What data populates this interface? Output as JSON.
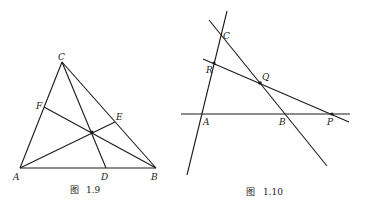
{
  "figures": [
    {
      "id": "fig-1-9",
      "caption": {
        "prefix": "图",
        "number": "1.9"
      },
      "points": {
        "A": {
          "label": "A",
          "x": 20,
          "y": 168
        },
        "B": {
          "label": "B",
          "x": 156,
          "y": 168
        },
        "C": {
          "label": "C",
          "x": 62,
          "y": 62
        },
        "D": {
          "label": "D",
          "x": 106,
          "y": 168
        },
        "E": {
          "label": "E",
          "x": 115,
          "y": 122
        },
        "F": {
          "label": "F",
          "x": 44,
          "y": 107
        },
        "O": {
          "x": 92,
          "y": 132
        }
      },
      "segments": [
        [
          "A",
          "B"
        ],
        [
          "B",
          "C"
        ],
        [
          "C",
          "A"
        ],
        [
          "C",
          "D"
        ],
        [
          "A",
          "E"
        ],
        [
          "B",
          "F"
        ]
      ]
    },
    {
      "id": "fig-1-10",
      "caption": {
        "prefix": "图",
        "number": "1.10"
      },
      "points": {
        "A": {
          "label": "A",
          "x": 202,
          "y": 114
        },
        "B": {
          "label": "B",
          "x": 285,
          "y": 114
        },
        "C": {
          "label": "C",
          "x": 221,
          "y": 34
        },
        "P": {
          "label": "P",
          "x": 332,
          "y": 114
        },
        "Q": {
          "label": "Q",
          "x": 260,
          "y": 83
        },
        "R": {
          "label": "R",
          "x": 214,
          "y": 63
        }
      },
      "lines": [
        {
          "name": "line-AB",
          "x1": 181,
          "y1": 114,
          "x2": 350,
          "y2": 114
        },
        {
          "name": "line-AC",
          "x1": 227,
          "y1": 11,
          "x2": 187,
          "y2": 175
        },
        {
          "name": "line-CB",
          "x1": 209,
          "y1": 20,
          "x2": 327,
          "y2": 166
        },
        {
          "name": "line-RP",
          "x1": 203,
          "y1": 59,
          "x2": 349,
          "y2": 122
        }
      ]
    }
  ]
}
